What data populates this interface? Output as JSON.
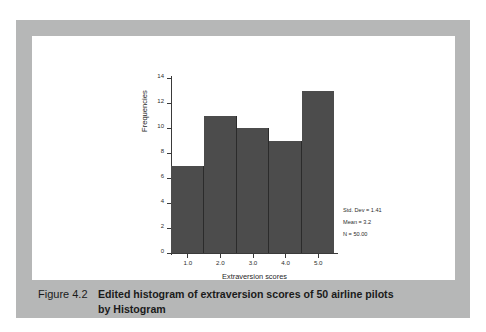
{
  "figure": {
    "caption_number": "Figure 4.2",
    "caption_title": "Edited histogram of extraversion scores of 50 airline pilots",
    "caption_title_line2": "by Histogram"
  },
  "colors": {
    "bar_fill": "#4c4c4c",
    "bar_edge": "#2b2b2b",
    "frame": "#b6b7b7",
    "panel": "#ffffff",
    "axis": "#3a3a3a",
    "text": "#1f1f1f"
  },
  "stats": {
    "std_dev": "Std. Dev = 1.41",
    "mean": "Mean = 3.2",
    "n": "N = 50.00"
  },
  "chart_data": {
    "type": "bar",
    "title": "",
    "xlabel": "Extraversion scores",
    "ylabel": "Frequencies",
    "categories": [
      "1.0",
      "2.0",
      "3.0",
      "4.0",
      "5.0"
    ],
    "values": [
      7,
      11,
      10,
      9,
      13
    ],
    "ylim": [
      0,
      14
    ],
    "yticks": [
      0,
      2,
      4,
      6,
      8,
      10,
      12,
      14
    ],
    "ytick_labels": [
      "0",
      "2",
      "4",
      "6",
      "8",
      "10",
      "12",
      "14"
    ],
    "xtick_labels": [
      "1.0",
      "2.0",
      "3.0",
      "4.0",
      "5.0"
    ],
    "grid": false,
    "legend": "none",
    "annotations": [
      "Std. Dev = 1.41",
      "Mean = 3.2",
      "N = 50.00"
    ]
  }
}
